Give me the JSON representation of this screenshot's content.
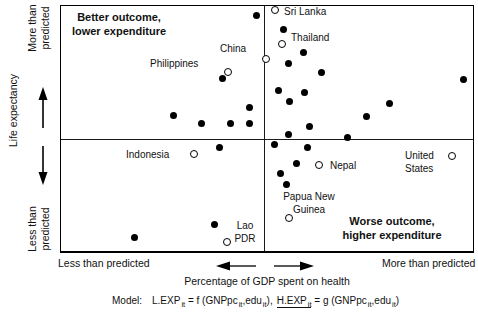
{
  "chart_data": {
    "type": "scatter",
    "title": "",
    "xlabel": "Percentage of GDP spent on health",
    "ylabel": "Life expectancy",
    "x_axis_annotations": {
      "left": "Less than predicted",
      "right": "More than predicted"
    },
    "y_axis_annotations": {
      "top_line1": "More than",
      "top_line2": "predicted",
      "bottom_line1": "Less than",
      "bottom_line2": "predicted"
    },
    "quadrant_annotations": {
      "top_left_line1": "Better outcome,",
      "top_left_line2": "lower expenditure",
      "bottom_right_line1": "Worse outcome,",
      "bottom_right_line2": "higher expenditure"
    },
    "axes_note": "Qualitative residual axes (observed minus model-predicted); no numeric ticks. Point coordinates are screenshot pixel positions.",
    "plot_area_px": {
      "left": 60,
      "top": 5,
      "right": 474,
      "bottom": 253,
      "midline_x": 265,
      "midline_y": 139
    },
    "series": [
      {
        "name": "Unlabeled countries",
        "marker": "filled-circle",
        "points_px": [
          [
            256,
            15
          ],
          [
            283,
            29
          ],
          [
            303,
            52
          ],
          [
            288,
            63
          ],
          [
            321,
            72
          ],
          [
            222,
            78
          ],
          [
            463,
            79
          ],
          [
            278,
            90
          ],
          [
            304,
            92
          ],
          [
            289,
            101
          ],
          [
            389,
            103
          ],
          [
            249,
            107
          ],
          [
            173,
            115
          ],
          [
            366,
            116
          ],
          [
            201,
            123
          ],
          [
            230,
            123
          ],
          [
            249,
            123
          ],
          [
            309,
            126
          ],
          [
            288,
            134
          ],
          [
            347,
            137
          ],
          [
            274,
            144
          ],
          [
            307,
            147
          ],
          [
            219,
            147
          ],
          [
            296,
            163
          ],
          [
            280,
            173
          ],
          [
            286,
            184
          ],
          [
            214,
            224
          ],
          [
            134,
            237
          ]
        ]
      },
      {
        "name": "Labeled countries",
        "marker": "open-circle",
        "points_px": [
          {
            "name": "Sri Lanka",
            "x": 275,
            "y": 10,
            "label_lines": [
              "Sri Lanka"
            ],
            "label_left": 284,
            "label_top": 5,
            "align": "left",
            "width": 50
          },
          {
            "name": "Thailand",
            "x": 282,
            "y": 44,
            "label_lines": [
              "Thailand"
            ],
            "label_left": 291,
            "label_top": 31,
            "align": "left",
            "width": 45
          },
          {
            "name": "China",
            "x": 266,
            "y": 59,
            "label_lines": [
              "China"
            ],
            "label_left": 220,
            "label_top": 42,
            "align": "left",
            "width": 34
          },
          {
            "name": "Philippines",
            "x": 228,
            "y": 72,
            "label_lines": [
              "Philippines"
            ],
            "label_left": 150,
            "label_top": 57,
            "align": "left",
            "width": 56
          },
          {
            "name": "Indonesia",
            "x": 194,
            "y": 154,
            "label_lines": [
              "Indonesia"
            ],
            "label_left": 126,
            "label_top": 148,
            "align": "left",
            "width": 48
          },
          {
            "name": "Nepal",
            "x": 319,
            "y": 165,
            "label_lines": [
              "Nepal"
            ],
            "label_left": 330,
            "label_top": 159,
            "align": "left",
            "width": 32
          },
          {
            "name": "Papua New Guinea",
            "x": 289,
            "y": 218,
            "label_lines": [
              "Papua New",
              "Guinea"
            ],
            "label_left": 277,
            "label_top": 190,
            "align": "center",
            "width": 64
          },
          {
            "name": "Lao PDR",
            "x": 227,
            "y": 242,
            "label_lines": [
              "Lao",
              "PDR"
            ],
            "label_left": 232,
            "label_top": 219,
            "align": "center",
            "width": 26
          },
          {
            "name": "United States",
            "x": 452,
            "y": 156,
            "label_lines": [
              "United",
              "States"
            ],
            "label_left": 405,
            "label_top": 149,
            "align": "left",
            "width": 38
          }
        ]
      }
    ],
    "legend": "off",
    "grid": "off",
    "colors": {
      "marker": "#000000",
      "text": "#111111",
      "line": "#000000",
      "background": "#ffffff"
    },
    "icons": {
      "y_up_arrow": "up-arrow",
      "y_down_arrow": "down-arrow",
      "x_left_arrow": "left-arrow",
      "x_right_arrow": "right-arrow"
    }
  },
  "formula": {
    "label": "Model:",
    "p1": "L.EXP",
    "sub": "it",
    "p2": " = f (GNPpc",
    "p3": ",edu",
    "p4": "),",
    "p5": "H.EXP",
    "p6": " = g (GNPpc",
    "p7": ",edu",
    "p8": ")"
  }
}
